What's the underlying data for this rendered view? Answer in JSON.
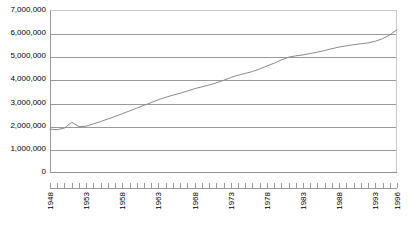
{
  "chart_data": {
    "type": "line",
    "title": "",
    "subtitle": "",
    "xlabel": "",
    "ylabel": "",
    "ylim": [
      0,
      7000000
    ],
    "xlim": [
      1948,
      1996
    ],
    "grid": true,
    "legend": false,
    "legend_position": "none",
    "y_ticks": [
      0,
      1000000,
      2000000,
      3000000,
      4000000,
      5000000,
      6000000,
      7000000
    ],
    "y_tick_labels": [
      "0",
      "1,000,000",
      "2,000,000",
      "3,000,000",
      "4,000,000",
      "5,000,000",
      "6,000,000",
      "7,000,000"
    ],
    "x_tick_labels": [
      "1948",
      "1953",
      "1958",
      "1963",
      "1968",
      "1973",
      "1978",
      "1983",
      "1988",
      "1993",
      "1996"
    ],
    "x_tick_label_years": [
      1948,
      1953,
      1958,
      1963,
      1968,
      1973,
      1978,
      1983,
      1988,
      1993,
      1996
    ],
    "series": [
      {
        "name": "Series 1",
        "color": "#8a8a8a",
        "x": [
          1948,
          1949,
          1950,
          1951,
          1952,
          1953,
          1954,
          1955,
          1956,
          1957,
          1958,
          1959,
          1960,
          1961,
          1962,
          1963,
          1964,
          1965,
          1966,
          1967,
          1968,
          1969,
          1970,
          1971,
          1972,
          1973,
          1974,
          1975,
          1976,
          1977,
          1978,
          1979,
          1980,
          1981,
          1982,
          1983,
          1984,
          1985,
          1986,
          1987,
          1988,
          1989,
          1990,
          1991,
          1992,
          1993,
          1994,
          1995,
          1996
        ],
        "values": [
          1850000,
          1830000,
          1900000,
          2150000,
          1960000,
          1980000,
          2080000,
          2180000,
          2290000,
          2400000,
          2520000,
          2640000,
          2760000,
          2880000,
          3000000,
          3120000,
          3230000,
          3320000,
          3400000,
          3500000,
          3600000,
          3680000,
          3760000,
          3850000,
          3960000,
          4080000,
          4180000,
          4260000,
          4340000,
          4450000,
          4580000,
          4700000,
          4840000,
          4960000,
          5020000,
          5060000,
          5120000,
          5180000,
          5250000,
          5330000,
          5400000,
          5450000,
          5500000,
          5540000,
          5580000,
          5650000,
          5760000,
          5920000,
          6150000
        ]
      }
    ]
  },
  "axes": {
    "y_labels": [
      {
        "value": 7000000,
        "text": "7,000,000"
      },
      {
        "value": 6000000,
        "text": "6,000,000"
      },
      {
        "value": 5000000,
        "text": "5,000,000"
      },
      {
        "value": 4000000,
        "text": "4,000,000"
      },
      {
        "value": 3000000,
        "text": "3,000,000"
      },
      {
        "value": 2000000,
        "text": "2,000,000"
      },
      {
        "value": 1000000,
        "text": "1,000,000"
      },
      {
        "value": 0,
        "text": "0"
      }
    ],
    "x_labels": [
      {
        "year": 1948,
        "text": "1948"
      },
      {
        "year": 1953,
        "text": "1953"
      },
      {
        "year": 1958,
        "text": "1958"
      },
      {
        "year": 1963,
        "text": "1963"
      },
      {
        "year": 1968,
        "text": "1968"
      },
      {
        "year": 1973,
        "text": "1973"
      },
      {
        "year": 1978,
        "text": "1978"
      },
      {
        "year": 1983,
        "text": "1983"
      },
      {
        "year": 1988,
        "text": "1988"
      },
      {
        "year": 1993,
        "text": "1993"
      },
      {
        "year": 1996,
        "text": "1996"
      }
    ]
  },
  "style": {
    "gridline_color": "#9a9a9a",
    "series_color": "#8a8a8a",
    "background": "#ffffff",
    "text_color": "#000000"
  }
}
